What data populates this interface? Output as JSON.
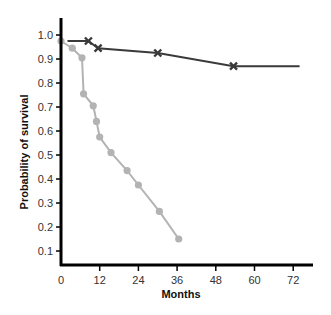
{
  "chart_data": {
    "type": "line",
    "title": "",
    "xlabel": "Months",
    "ylabel": "Probability of survival",
    "xlim": [
      0,
      76
    ],
    "ylim": [
      0.06,
      1.06
    ],
    "xticks": [
      0,
      12,
      24,
      36,
      48,
      60,
      72
    ],
    "yticks": [
      0.1,
      0.2,
      0.3,
      0.4,
      0.5,
      0.6,
      0.7,
      0.8,
      0.9,
      1.0
    ],
    "ytick_labels": [
      "0.1",
      "0.2",
      "0.3",
      "0.4",
      "0.5",
      "0.6",
      "0.7",
      "0.8",
      "0.9",
      "1.0"
    ],
    "xtick_labels": [
      "0",
      "12",
      "24",
      "36",
      "48",
      "60",
      "72"
    ],
    "grid": false,
    "legend": null,
    "series": [
      {
        "name": "Group A (dark, x markers)",
        "color": "#3a3a3a",
        "marker": "x",
        "step": false,
        "line_start": [
          2,
          0.975
        ],
        "line_end": [
          74,
          0.87
        ],
        "x": [
          8.5,
          11.5,
          30,
          53.5
        ],
        "y": [
          0.975,
          0.945,
          0.925,
          0.87
        ]
      },
      {
        "name": "Group B (gray, circle markers)",
        "color": "#b3b3b3",
        "marker": "o",
        "x": [
          0,
          3.5,
          6.5,
          7,
          10,
          11,
          12,
          15.5,
          20.5,
          24,
          30.5,
          36.5
        ],
        "y": [
          0.975,
          0.945,
          0.905,
          0.755,
          0.705,
          0.64,
          0.575,
          0.51,
          0.435,
          0.375,
          0.265,
          0.15
        ]
      }
    ]
  }
}
